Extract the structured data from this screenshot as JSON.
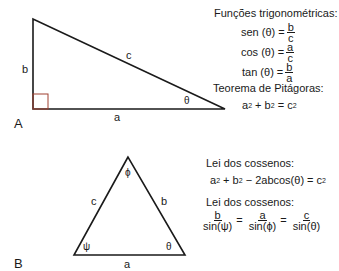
{
  "panelA": {
    "label": "A",
    "sides": {
      "a": "a",
      "b": "b",
      "c": "c"
    },
    "angle": "θ",
    "right_angle_color": "#a04030",
    "title_trig": "Funções trigonométricas:",
    "trig": [
      {
        "lhs": "sen (θ) =",
        "num": "b",
        "den": "c"
      },
      {
        "lhs": "cos (θ) =",
        "num": "a",
        "den": "c"
      },
      {
        "lhs": "tan (θ) =",
        "num": "b",
        "den": "a"
      }
    ],
    "title_pyth": "Teorema de Pitágoras:",
    "pyth": {
      "a": "a",
      "plus": " + ",
      "b": "b",
      "eq": " = ",
      "c": "c",
      "exp": "2"
    }
  },
  "panelB": {
    "label": "B",
    "sides": {
      "a": "a",
      "b": "b",
      "c": "c"
    },
    "angles": {
      "top": "ϕ",
      "left": "ψ",
      "right": "θ"
    },
    "title_cos": "Lei dos cossenos:",
    "cos_law": {
      "a": "a",
      "plus": " + ",
      "b": "b",
      "rest": " − 2abcos(θ) = ",
      "c": "c",
      "exp": "2"
    },
    "title_sin": "Lei dos cossenos:",
    "sin_law": [
      {
        "num": "b",
        "den": "sin(ψ)"
      },
      {
        "num": "a",
        "den": "sin(ϕ)"
      },
      {
        "num": "c",
        "den": "sin(θ)"
      }
    ],
    "eq_sign": "="
  }
}
